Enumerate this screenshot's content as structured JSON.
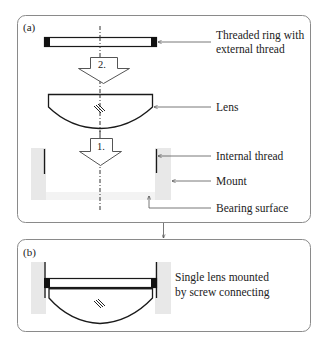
{
  "panel_a": {
    "tag": "(a)",
    "step_2": "2.",
    "step_1": "1.",
    "labels": {
      "ring_line1": "Threaded ring with",
      "ring_line2": "external thread",
      "lens": "Lens",
      "internal_thread": "Internal thread",
      "mount": "Mount",
      "bearing_surface": "Bearing surface"
    }
  },
  "panel_b": {
    "tag": "(b)",
    "caption_line1": "Single lens mounted",
    "caption_line2": "by screw connecting"
  },
  "colors": {
    "border": "#8a8a8a",
    "mount_fill": "#e8e8e8",
    "line": "#1a1a1a",
    "leader": "#555555"
  }
}
